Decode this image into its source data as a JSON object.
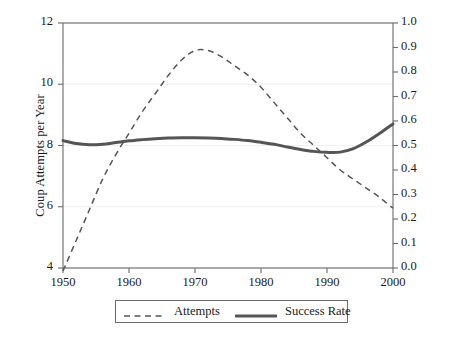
{
  "chart_data": {
    "type": "line",
    "title": "",
    "xlabel": "",
    "ylabel": "Coup Attempts per Year",
    "ylabel_right": "Success Rate",
    "xlim": [
      1950,
      2000
    ],
    "ylim": [
      4,
      12
    ],
    "ylim_right": [
      0.0,
      1.0
    ],
    "xticks": [
      1950,
      1960,
      1970,
      1980,
      1990,
      2000
    ],
    "xtick_labels": [
      "1950",
      "1960",
      "1970",
      "1980",
      "1990",
      "2000"
    ],
    "yticks": [
      4,
      6,
      8,
      10,
      12
    ],
    "ytick_labels": [
      "4",
      "6",
      "8",
      "10",
      "12"
    ],
    "yticks_right": [
      0.0,
      0.1,
      0.2,
      0.3,
      0.4,
      0.5,
      0.6,
      0.7,
      0.8,
      0.9,
      1.0
    ],
    "ytick_labels_right": [
      "0.0",
      "0.1",
      "0.2",
      "0.3",
      "0.4",
      "0.5",
      "0.6",
      "0.7",
      "0.8",
      "0.9",
      "1.0"
    ],
    "grid": true,
    "legend_position": "bottom-center",
    "series": [
      {
        "name": "Attempts",
        "axis": "left",
        "style": "dashed",
        "color": "#555555",
        "x": [
          1950,
          1952,
          1954,
          1956,
          1958,
          1960,
          1962,
          1964,
          1966,
          1968,
          1970,
          1972,
          1974,
          1976,
          1978,
          1980,
          1982,
          1984,
          1986,
          1988,
          1990,
          1992,
          1994,
          1996,
          1998,
          2000
        ],
        "values": [
          3.9,
          4.9,
          5.9,
          6.9,
          7.7,
          8.4,
          9.1,
          9.7,
          10.3,
          10.8,
          11.1,
          11.1,
          10.9,
          10.6,
          10.3,
          9.9,
          9.4,
          8.9,
          8.4,
          8.0,
          7.6,
          7.2,
          6.9,
          6.6,
          6.3,
          5.95
        ]
      },
      {
        "name": "Success Rate",
        "axis": "right",
        "style": "solid",
        "color": "#555555",
        "x": [
          1950,
          1952,
          1954,
          1956,
          1958,
          1960,
          1962,
          1964,
          1966,
          1968,
          1970,
          1972,
          1974,
          1976,
          1978,
          1980,
          1982,
          1984,
          1986,
          1988,
          1990,
          1992,
          1994,
          1996,
          1998,
          2000
        ],
        "values": [
          0.52,
          0.508,
          0.503,
          0.505,
          0.512,
          0.519,
          0.524,
          0.528,
          0.531,
          0.532,
          0.532,
          0.531,
          0.529,
          0.525,
          0.52,
          0.513,
          0.505,
          0.494,
          0.484,
          0.476,
          0.472,
          0.473,
          0.487,
          0.515,
          0.55,
          0.588
        ]
      }
    ],
    "legend": [
      {
        "label": "Attempts",
        "style": "dashed",
        "color": "#555555"
      },
      {
        "label": "Success Rate",
        "style": "solid",
        "color": "#555555"
      }
    ]
  },
  "colors": {
    "axis": "#6b6b6b",
    "grid": "#efefef",
    "line": "#555555",
    "text": "#1a1a1a",
    "background": "#ffffff"
  }
}
